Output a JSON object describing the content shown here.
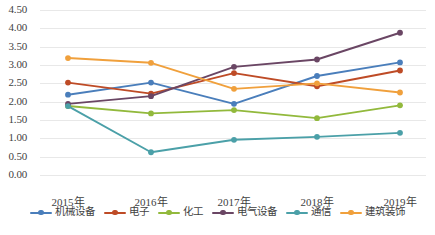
{
  "chart_data": {
    "type": "line",
    "title": "",
    "xlabel": "",
    "ylabel": "",
    "categories": [
      "2015年",
      "2016年",
      "2017年",
      "2018年",
      "2019年"
    ],
    "ylim": [
      0.0,
      4.5
    ],
    "ytick_step": 0.5,
    "yticks": [
      "0.00",
      "0.50",
      "1.00",
      "1.50",
      "2.00",
      "2.50",
      "3.00",
      "3.50",
      "4.00",
      "4.50"
    ],
    "grid": true,
    "legend_position": "bottom",
    "markers": true,
    "series": [
      {
        "name": "机械设备",
        "color": "#4a7ebb",
        "values": [
          2.19,
          2.52,
          1.94,
          2.7,
          3.07
        ]
      },
      {
        "name": "电子",
        "color": "#be4b26",
        "values": [
          2.52,
          2.22,
          2.78,
          2.42,
          2.85
        ]
      },
      {
        "name": "化工",
        "color": "#92b93c",
        "values": [
          1.88,
          1.68,
          1.77,
          1.55,
          1.9
        ]
      },
      {
        "name": "电气设备",
        "color": "#6a4664",
        "values": [
          1.94,
          2.15,
          2.95,
          3.15,
          3.88
        ]
      },
      {
        "name": "通信",
        "color": "#4ba0a8",
        "values": [
          1.88,
          0.62,
          0.96,
          1.04,
          1.15
        ]
      },
      {
        "name": "建筑装饰",
        "color": "#f0a03c",
        "values": [
          3.19,
          3.06,
          2.35,
          2.5,
          2.25
        ]
      }
    ]
  }
}
